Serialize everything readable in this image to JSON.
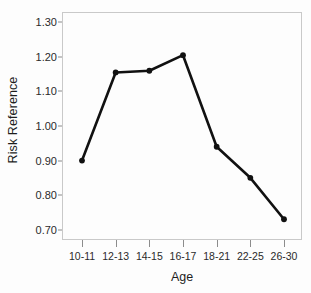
{
  "chart_data": {
    "type": "line",
    "title": "",
    "xlabel": "Age",
    "ylabel": "Risk Reference",
    "categories": [
      "10-11",
      "12-13",
      "14-15",
      "16-17",
      "18-21",
      "22-25",
      "26-30"
    ],
    "values": [
      0.9,
      1.155,
      1.16,
      1.205,
      0.94,
      0.85,
      0.73
    ],
    "series": [
      {
        "name": "Risk Reference",
        "values": [
          0.9,
          1.155,
          1.16,
          1.205,
          0.94,
          0.85,
          0.73
        ]
      }
    ],
    "ylim": [
      0.67,
      1.33
    ],
    "yticks": [
      0.7,
      0.8,
      0.9,
      1.0,
      1.1,
      1.2,
      1.3
    ],
    "ytick_labels": [
      "0.70",
      "0.80",
      "0.90",
      "1.00",
      "1.10",
      "1.20",
      "1.30"
    ],
    "grid": false,
    "legend": false,
    "legend_position": "none",
    "line_color": "#111111",
    "marker": "circle",
    "marker_color": "#111111",
    "frame_color": "#c9c9c9",
    "background_color": "#fdfdfd"
  }
}
